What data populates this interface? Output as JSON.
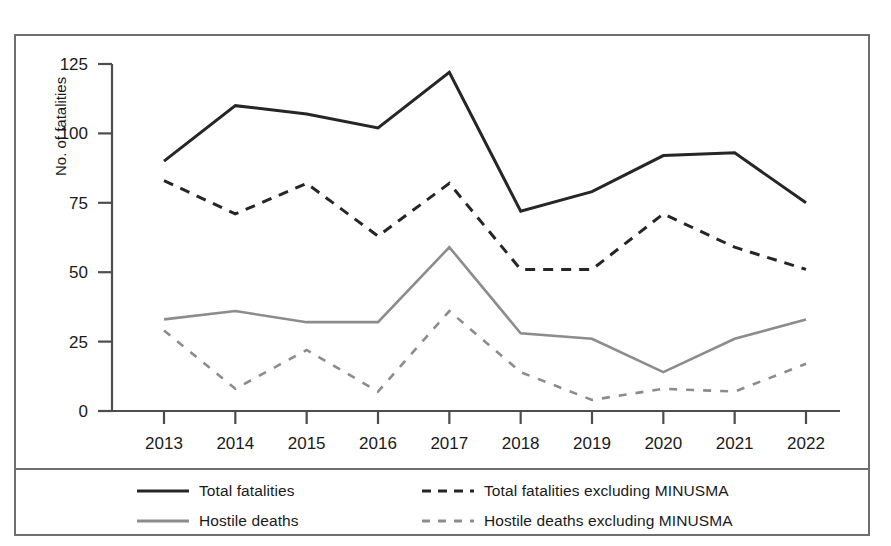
{
  "chart_data": {
    "type": "line",
    "title": "",
    "xlabel": "",
    "ylabel": "No. of fatalities",
    "categories": [
      "2013",
      "2014",
      "2015",
      "2016",
      "2017",
      "2018",
      "2019",
      "2020",
      "2021",
      "2022"
    ],
    "ylim": [
      0,
      125
    ],
    "yticks": [
      0,
      25,
      50,
      75,
      100,
      125
    ],
    "ytick_labels": [
      "0",
      "25",
      "50",
      "75",
      "100",
      "125"
    ],
    "grid": false,
    "legend_position": "bottom",
    "series": [
      {
        "name": "Total fatalities",
        "style": "solid",
        "color": "#262626",
        "width": 3.0,
        "values": [
          90,
          110,
          107,
          102,
          122,
          72,
          79,
          92,
          93,
          75
        ]
      },
      {
        "name": "Total fatalities excluding MINUSMA",
        "style": "dashed",
        "color": "#262626",
        "width": 3.0,
        "values": [
          83,
          71,
          82,
          63,
          82,
          51,
          51,
          71,
          59,
          51
        ]
      },
      {
        "name": "Hostile deaths",
        "style": "solid",
        "color": "#8c8c8c",
        "width": 2.6,
        "values": [
          33,
          36,
          32,
          32,
          59,
          28,
          26,
          14,
          26,
          33
        ]
      },
      {
        "name": "Hostile deaths excluding MINUSMA",
        "style": "dashed",
        "color": "#8c8c8c",
        "width": 2.6,
        "values": [
          29,
          8,
          22,
          7,
          36,
          14,
          4,
          8,
          7,
          17
        ]
      }
    ]
  },
  "legend": {
    "entries": [
      {
        "label": "Total fatalities",
        "style": "solid",
        "color": "#262626"
      },
      {
        "label": "Total fatalities excluding MINUSMA",
        "style": "dashed",
        "color": "#262626"
      },
      {
        "label": "Hostile deaths",
        "style": "solid",
        "color": "#8c8c8c"
      },
      {
        "label": "Hostile deaths excluding MINUSMA",
        "style": "dashed",
        "color": "#8c8c8c"
      }
    ]
  },
  "figure": {
    "border_color": "#6f6f6f",
    "background": "#ffffff",
    "axis_color": "#4d4d4d"
  }
}
